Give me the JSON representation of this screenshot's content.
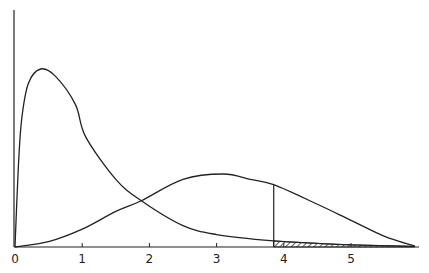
{
  "chart_data": {
    "type": "line",
    "title": "",
    "xlabel": "",
    "ylabel": "",
    "xlim": [
      0,
      6
    ],
    "ylim": [
      0,
      1.05
    ],
    "x_ticks": [
      "0",
      "1",
      "2",
      "3",
      "4",
      "5"
    ],
    "grid": false,
    "legend": null,
    "series": [
      {
        "name": "curve-1 (right-skewed, peak near x=0.4)",
        "x": [
          0,
          0.05,
          0.1,
          0.2,
          0.38,
          0.6,
          0.9,
          1.05,
          1.5,
          1.88,
          2.5,
          3.0,
          3.85,
          4.5,
          5.0,
          5.95
        ],
        "y": [
          0,
          0.45,
          0.72,
          0.92,
          1.0,
          0.96,
          0.8,
          0.62,
          0.38,
          0.26,
          0.12,
          0.07,
          0.034,
          0.02,
          0.012,
          0.003
        ]
      },
      {
        "name": "curve-2 (peak near x=3.1)",
        "x": [
          0,
          0.5,
          1.0,
          1.5,
          1.88,
          2.5,
          3.1,
          3.5,
          3.85,
          4.5,
          5.0,
          5.5,
          5.95
        ],
        "y": [
          0,
          0.03,
          0.1,
          0.2,
          0.26,
          0.38,
          0.41,
          0.38,
          0.35,
          0.24,
          0.15,
          0.06,
          0.005
        ]
      }
    ],
    "annotations": [
      {
        "type": "vertical-line",
        "x": 3.85,
        "note": "critical value line up to curve-2"
      },
      {
        "type": "hatched-area",
        "x_from": 3.85,
        "x_to": 5.95,
        "under": "curve-1",
        "note": "tail area under curve-1 beyond critical value"
      },
      {
        "type": "intersection",
        "x": 1.88,
        "y": 0.26
      }
    ]
  }
}
